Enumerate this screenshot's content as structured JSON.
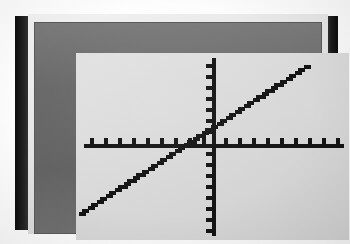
{
  "device": {
    "name": "graphing-calculator",
    "bezel_color": "#171717",
    "body_color": "#e4e4e4",
    "frame_color": "#6d6d6d",
    "screen_color": "#dadada",
    "ink_color": "#141414",
    "label": "Graphing calculator LCD screen"
  },
  "chart_data": {
    "type": "line",
    "title": "",
    "subtitle": "",
    "xlabel": "",
    "ylabel": "",
    "grid": false,
    "legend": null,
    "axis_style": "cartesian-crosshair-with-tick-marks",
    "render_style": "pixelated-lcd-dots",
    "xlim": [
      -10,
      10
    ],
    "ylim": [
      -8,
      8
    ],
    "xticks": [
      -9,
      -8,
      -7,
      -6,
      -5,
      -4,
      -3,
      -2,
      -1,
      1,
      2,
      3,
      4,
      5,
      6,
      7,
      8,
      9
    ],
    "yticks": [
      -7,
      -6,
      -5,
      -4,
      -3,
      -2,
      -1,
      1,
      2,
      3,
      4,
      5,
      6,
      7
    ],
    "x_tick_count_left": 9,
    "x_tick_count_right": 9,
    "y_tick_count_above": 7,
    "y_tick_count_below": 7,
    "series": [
      {
        "name": "line",
        "equation": "y = 0.83x + 2",
        "slope": 0.83,
        "intercept": 2,
        "x_intercept": -2.4,
        "x": [
          -8.5,
          -7.5,
          -6.5,
          -5.5,
          -4.5,
          -3.5,
          -2.5,
          -1.5,
          -0.5,
          0,
          0.5,
          1.5,
          2.5,
          3.5,
          4.5,
          5.5,
          6.5,
          7.5,
          8.5,
          9.5
        ],
        "values": [
          -5.06,
          -4.23,
          -3.4,
          -2.57,
          -1.74,
          -0.91,
          -0.08,
          0.76,
          1.59,
          2.0,
          2.42,
          3.25,
          4.08,
          4.91,
          5.74,
          6.57,
          7.4,
          8.23,
          9.06,
          9.89
        ],
        "visible_x_range": [
          -9.6,
          6.6
        ],
        "visible_y_range": [
          -6.0,
          5.6
        ],
        "color": "#141414"
      }
    ],
    "annotations": []
  },
  "screen": {
    "mode_label": "graph",
    "cursor_visible": false
  }
}
